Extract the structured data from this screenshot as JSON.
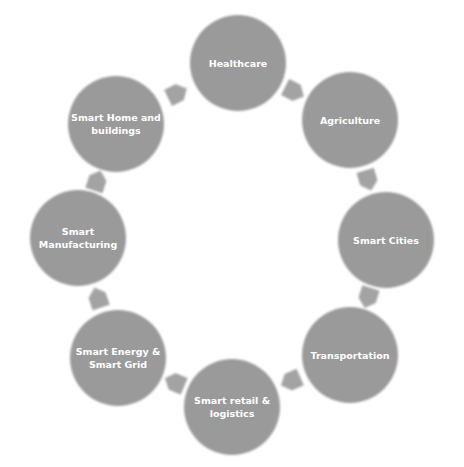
{
  "diagram": {
    "colors": {
      "node": "#9a9a9a",
      "arrow": "#a3a3a3",
      "text": "#ffffff",
      "background": "#ffffff"
    },
    "nodes": [
      {
        "id": "healthcare",
        "lines": [
          "Healthcare"
        ]
      },
      {
        "id": "agriculture",
        "lines": [
          "Agriculture"
        ]
      },
      {
        "id": "smart-cities",
        "lines": [
          "Smart Cities"
        ]
      },
      {
        "id": "transportation",
        "lines": [
          "Transportation"
        ]
      },
      {
        "id": "smart-retail-logistics",
        "lines": [
          "Smart retail &",
          "logistics"
        ]
      },
      {
        "id": "smart-energy-grid",
        "lines": [
          "Smart Energy &",
          "Smart Grid"
        ]
      },
      {
        "id": "smart-manufacturing",
        "lines": [
          "Smart",
          "Manufacturing"
        ]
      },
      {
        "id": "smart-home-buildings",
        "lines": [
          "Smart Home and",
          "buildings"
        ]
      }
    ],
    "flow": "clockwise"
  }
}
